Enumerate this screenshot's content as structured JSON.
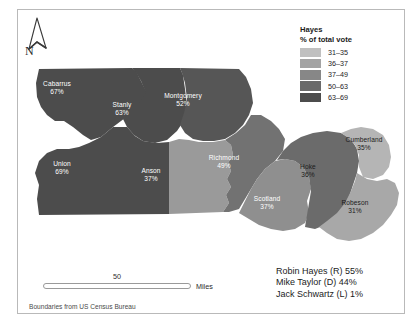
{
  "map": {
    "title_region": "North Carolina 8th Congressional District counties",
    "counties": [
      {
        "name": "Cabarrus",
        "value": "67%",
        "bin": "63-69",
        "fill": "#4c4c4c",
        "label_color": "light",
        "x": 57,
        "y": 84
      },
      {
        "name": "Stanly",
        "value": "63%",
        "bin": "63-69",
        "fill": "#4c4c4c",
        "label_color": "light",
        "x": 122,
        "y": 105
      },
      {
        "name": "Montgomery",
        "value": "52%",
        "bin": "50-63",
        "fill": "#565656",
        "label_color": "light",
        "x": 183,
        "y": 96
      },
      {
        "name": "Union",
        "value": "69%",
        "bin": "63-69",
        "fill": "#4c4c4c",
        "label_color": "light",
        "x": 62,
        "y": 164
      },
      {
        "name": "Anson",
        "value": "37%",
        "bin": "37-49",
        "fill": "#9a9a9a",
        "label_color": "light",
        "x": 151,
        "y": 171
      },
      {
        "name": "Richmond",
        "value": "49%",
        "bin": "37-49",
        "fill": "#727272",
        "label_color": "light",
        "x": 224,
        "y": 158
      },
      {
        "name": "Scotland",
        "value": "37%",
        "bin": "36-37",
        "fill": "#8f8f8f",
        "label_color": "light",
        "x": 267,
        "y": 199
      },
      {
        "name": "Hoke",
        "value": "36%",
        "bin": "36-37",
        "fill": "#6b6b6b",
        "label_color": "dark",
        "x": 308,
        "y": 167
      },
      {
        "name": "Cumberland",
        "value": "35%",
        "bin": "31-35",
        "fill": "#b5b5b5",
        "label_color": "dark",
        "x": 364,
        "y": 140
      },
      {
        "name": "Robeson",
        "value": "31%",
        "bin": "31-35",
        "fill": "#a8a8a8",
        "label_color": "dark",
        "x": 355,
        "y": 203
      }
    ]
  },
  "north_arrow": {
    "label": "N"
  },
  "legend": {
    "title": "Hayes",
    "subtitle": "% of total vote",
    "items": [
      {
        "range": "31–35",
        "color": "#c0c0c0"
      },
      {
        "range": "36–37",
        "color": "#a3a3a3"
      },
      {
        "range": "37–49",
        "color": "#878787"
      },
      {
        "range": "50–63",
        "color": "#6a6a6a"
      },
      {
        "range": "63–69",
        "color": "#4c4c4c"
      }
    ]
  },
  "scalebar": {
    "value": "50",
    "units": "Miles"
  },
  "credit": {
    "text": "Boundaries from US Census Bureau"
  },
  "results": {
    "lines": [
      "Robin Hayes (R) 55%",
      "Mike Taylor (D) 44%",
      "Jack Schwartz (L) 1%"
    ]
  }
}
